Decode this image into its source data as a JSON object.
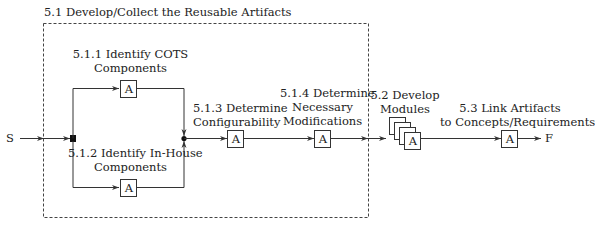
{
  "group": {
    "title": "5.1 Develop/Collect the Reusable Artifacts"
  },
  "nodes": {
    "start": "S",
    "finish": "F",
    "box_glyph": "A",
    "n511": {
      "line1": "5.1.1 Identify COTS",
      "line2": "Components"
    },
    "n512": {
      "line1": "5.1.2 Identify In-House",
      "line2": "Components"
    },
    "n513": {
      "line1": "5.1.3 Determine",
      "line2": "Configurability"
    },
    "n514": {
      "line1": "5.1.4 Determine",
      "line2": "Necessary",
      "line3": "Modifications"
    },
    "n52": {
      "line1": "5.2 Develop",
      "line2": "Modules"
    },
    "n53": {
      "line1": "5.3 Link Artifacts",
      "line2": "to Concepts/Requirements"
    }
  },
  "colors": {
    "stroke": "#333333",
    "dash": "#444444"
  }
}
